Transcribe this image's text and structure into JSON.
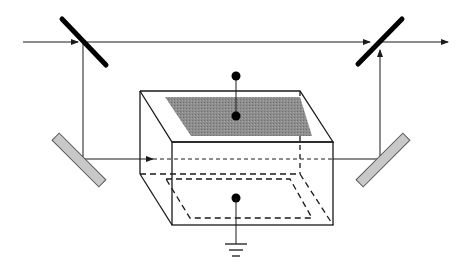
{
  "diagram": {
    "colors": {
      "line": "#1a1a1a",
      "beam_splitter": "#000000",
      "mirror_fill": "#c8c8c8",
      "mirror_stroke": "#555555",
      "electrode_fill": "#8a8a8a",
      "background": "#ffffff"
    },
    "components": [
      {
        "id": "input-beam",
        "type": "beam",
        "label": ""
      },
      {
        "id": "beam-splitter-left",
        "type": "beam-splitter",
        "label": ""
      },
      {
        "id": "beam-splitter-right",
        "type": "beam-splitter",
        "label": ""
      },
      {
        "id": "mirror-left",
        "type": "mirror",
        "label": ""
      },
      {
        "id": "mirror-right",
        "type": "mirror",
        "label": ""
      },
      {
        "id": "cell",
        "type": "box",
        "label": ""
      },
      {
        "id": "top-electrode",
        "type": "plate",
        "label": ""
      },
      {
        "id": "bottom-electrode",
        "type": "plate",
        "label": ""
      },
      {
        "id": "terminal-top",
        "type": "terminal",
        "label": ""
      },
      {
        "id": "ground",
        "type": "ground",
        "label": ""
      }
    ],
    "text_labels": []
  }
}
